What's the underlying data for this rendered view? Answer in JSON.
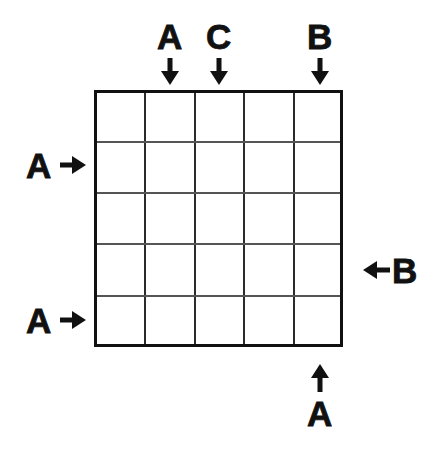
{
  "figure": {
    "type": "grid-with-direction-markers",
    "background_color": "#ffffff",
    "ink_color": "#111111",
    "grid": {
      "columns": 5,
      "rows": 5,
      "border_color": "#111111",
      "inner_line_color": "#555555"
    }
  },
  "markers": {
    "top": [
      {
        "label": "A",
        "icon": "arrow-down-icon",
        "column": 2
      },
      {
        "label": "C",
        "icon": "arrow-down-icon",
        "column": 3
      },
      {
        "label": "B",
        "icon": "arrow-down-icon",
        "column": 5
      }
    ],
    "left": [
      {
        "label": "A",
        "icon": "arrow-right-icon",
        "row": 2
      },
      {
        "label": "A",
        "icon": "arrow-right-icon",
        "row": 5
      }
    ],
    "right": [
      {
        "label": "B",
        "icon": "arrow-left-icon",
        "row": 4
      }
    ],
    "bottom": [
      {
        "label": "A",
        "icon": "arrow-up-icon",
        "column": 5
      }
    ]
  }
}
